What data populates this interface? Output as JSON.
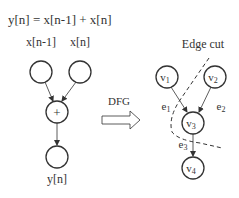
{
  "left": {
    "equation": "y[n] = x[n-1] + x[n]",
    "inputs": [
      {
        "label": "x[n-1]"
      },
      {
        "label": "x[n]"
      }
    ],
    "operator": "+",
    "output": {
      "label": "y[n]"
    }
  },
  "middle": {
    "arrow_label": "DFG"
  },
  "right": {
    "title": "Edge cut",
    "nodes": [
      {
        "id": "v1",
        "base": "v",
        "sub": "1"
      },
      {
        "id": "v2",
        "base": "v",
        "sub": "2"
      },
      {
        "id": "v3",
        "base": "v",
        "sub": "3"
      },
      {
        "id": "v4",
        "base": "v",
        "sub": "4"
      }
    ],
    "edges": [
      {
        "id": "e1",
        "base": "e",
        "sub": "1",
        "from": "v1",
        "to": "v3"
      },
      {
        "id": "e2",
        "base": "e",
        "sub": "2",
        "from": "v2",
        "to": "v3"
      },
      {
        "id": "e3",
        "base": "e",
        "sub": "3",
        "from": "v3",
        "to": "v4"
      }
    ]
  },
  "colors": {
    "stroke": "#333333",
    "text": "#333333",
    "background": "#ffffff"
  }
}
